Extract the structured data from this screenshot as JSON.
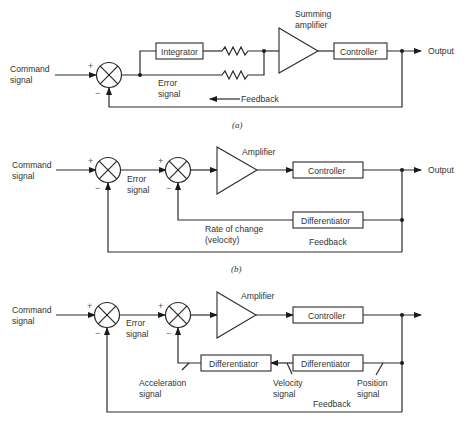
{
  "diagram_a": {
    "caption": "(a)",
    "input_label_1": "Command",
    "input_label_2": "signal",
    "plus": "+",
    "minus": "−",
    "integrator": "Integrator",
    "error_1": "Error",
    "error_2": "signal",
    "summing_1": "Summing",
    "summing_2": "amplifier",
    "controller": "Controller",
    "output": "Output",
    "feedback": "Feedback"
  },
  "diagram_b": {
    "caption": "(b)",
    "input_label_1": "Command",
    "input_label_2": "signal",
    "plus": "+",
    "minus": "−",
    "error_1": "Error",
    "error_2": "signal",
    "amplifier": "Amplifier",
    "controller": "Controller",
    "output": "Output",
    "differentiator": "Differentiator",
    "rate_1": "Rate of change",
    "rate_2": "(velocity)",
    "feedback": "Feedback"
  },
  "diagram_c": {
    "input_label_1": "Command",
    "input_label_2": "signal",
    "plus": "+",
    "minus": "−",
    "error_1": "Error",
    "error_2": "signal",
    "amplifier": "Amplifier",
    "controller": "Controller",
    "differentiator_1": "Differentiator",
    "differentiator_2": "Differentiator",
    "accel_1": "Acceleration",
    "accel_2": "signal",
    "velocity_1": "Velocity",
    "velocity_2": "signal",
    "position_1": "Position",
    "position_2": "signal",
    "feedback": "Feedback"
  }
}
